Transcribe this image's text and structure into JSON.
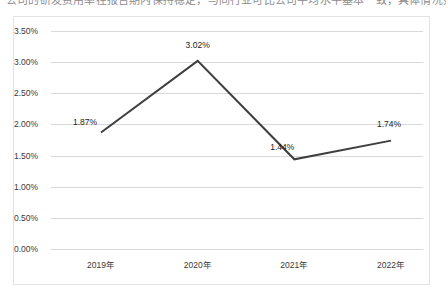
{
  "page": {
    "cutoff_top_text": "公司的研发费用率在报告期内保持稳定，与同行业可比公司平均水平基本一致，具体情况如下："
  },
  "chart_data": {
    "type": "line",
    "title": "",
    "subtitle": "",
    "xlabel": "",
    "ylabel": "",
    "categories": [
      "2019年",
      "2020年",
      "2021年",
      "2022年"
    ],
    "values": [
      1.87,
      3.02,
      1.44,
      1.74
    ],
    "value_labels": [
      "1.87%",
      "3.02%",
      "1.44%",
      "1.74%"
    ],
    "ylim": [
      0.0,
      3.5
    ],
    "ytick_values": [
      0.0,
      0.5,
      1.0,
      1.5,
      2.0,
      2.5,
      3.0,
      3.5
    ],
    "ytick_labels": [
      "0.00%",
      "0.50%",
      "1.00%",
      "1.50%",
      "2.00%",
      "2.50%",
      "3.00%",
      "3.50%"
    ],
    "grid": true,
    "legend": false,
    "legend_position": "none",
    "series": [
      {
        "name": "研发费用率",
        "values": [
          1.87,
          3.02,
          1.44,
          1.74
        ],
        "color": "#3f3f3f",
        "marker": "none"
      }
    ],
    "colors": {
      "line": "#3f3f3f",
      "grid": "#d9d9d9",
      "border": "#e3e3e3",
      "text": "#3a3a3a",
      "background": "#ffffff"
    }
  }
}
